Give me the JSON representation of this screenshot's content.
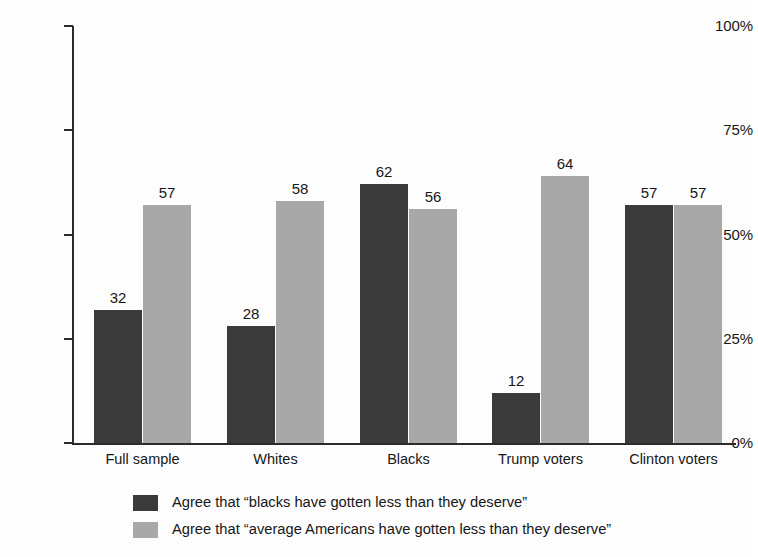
{
  "chart_data": {
    "type": "bar",
    "title": "",
    "subtitle": "",
    "xlabel": "",
    "ylabel": "",
    "ylim": [
      0,
      100
    ],
    "grid": false,
    "legend_position": "bottom",
    "y_ticks": [
      "0%",
      "25%",
      "50%",
      "75%",
      "100%"
    ],
    "y_tick_values": [
      0,
      25,
      50,
      75,
      100
    ],
    "categories": [
      "Full sample",
      "Whites",
      "Blacks",
      "Trump voters",
      "Clinton voters"
    ],
    "series": [
      {
        "name": "Agree that “blacks have gotten less than they deserve”",
        "color": "#3a3a3a",
        "values": [
          32,
          28,
          62,
          12,
          57
        ]
      },
      {
        "name": "Agree that “average Americans have gotten less than they deserve”",
        "color": "#a8a8a8",
        "values": [
          57,
          58,
          56,
          64,
          57
        ]
      }
    ]
  },
  "axis": {
    "color": "#2b2b2b"
  },
  "legend": {
    "items": [
      {
        "label": "Agree that “blacks have gotten less than they deserve”",
        "color": "#3a3a3a"
      },
      {
        "label": "Agree that “average Americans have gotten less than they deserve”",
        "color": "#a8a8a8"
      }
    ]
  }
}
